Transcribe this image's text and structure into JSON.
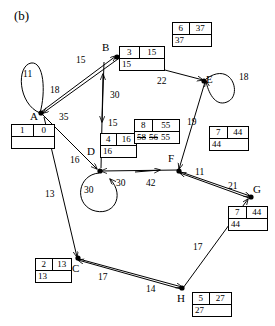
{
  "figure": {
    "caption": "(b)",
    "type": "directed-weighted-graph"
  },
  "nodes": [
    {
      "id": "A",
      "letter": "A"
    },
    {
      "id": "B",
      "letter": "B"
    },
    {
      "id": "C",
      "letter": "C"
    },
    {
      "id": "D",
      "letter": "D"
    },
    {
      "id": "E",
      "letter": "E"
    },
    {
      "id": "F",
      "letter": "F"
    },
    {
      "id": "G",
      "letter": "G"
    },
    {
      "id": "H",
      "letter": "H"
    }
  ],
  "edge_labels": {
    "a_loop": "11",
    "b_to_a": "18",
    "a_to_b": "15",
    "a_to_d": "35",
    "d_label_16": "16",
    "a_to_c": "13",
    "d_to_b": "30",
    "b_to_d": "15",
    "b_to_e": "22",
    "e_loop": "18",
    "e_to_f": "19",
    "f_to_d": "42",
    "d_incoming_30": "30",
    "d_loop": "30",
    "g_to_f": "11",
    "f_to_g": "21",
    "h_to_g": "17",
    "c_to_h": "14",
    "h_to_c": "17"
  },
  "label_boxes": [
    {
      "node": "A",
      "top_left": "1",
      "top_right": "0",
      "bottom": ""
    },
    {
      "node": "B",
      "top_left": "3",
      "top_right": "15",
      "bottom": "15"
    },
    {
      "node": "C",
      "top_left": "2",
      "top_right": "13",
      "bottom": "13"
    },
    {
      "node": "D",
      "top_left": "4",
      "top_right": "16",
      "bottom": "16"
    },
    {
      "node": "E",
      "top_left": "6",
      "top_right": "37",
      "bottom": "37"
    },
    {
      "node": "F",
      "top_left": "8",
      "top_right": "55",
      "bottom_sequence": [
        {
          "value": "58",
          "struck": true
        },
        {
          "value": "56",
          "struck": true
        },
        {
          "value": "55",
          "struck": false
        }
      ]
    },
    {
      "node": "G_upper",
      "top_left": "7",
      "top_right": "44",
      "bottom": "44"
    },
    {
      "node": "G",
      "top_left": "7",
      "top_right": "44",
      "bottom": "44"
    },
    {
      "node": "H",
      "top_left": "5",
      "top_right": "27",
      "bottom": "27"
    }
  ],
  "colors": {
    "stroke": "#000000",
    "background": "#ffffff"
  }
}
